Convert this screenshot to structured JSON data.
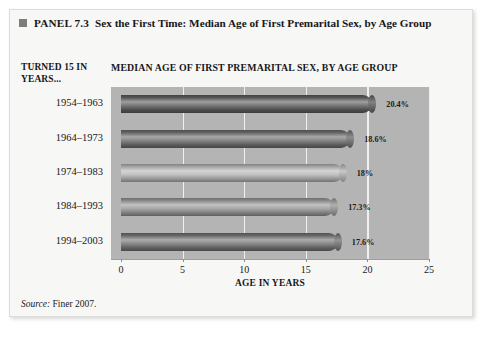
{
  "panel": {
    "marker_icon": "filled-square-icon",
    "number": "PANEL 7.3",
    "title": "Sex the First Time: Median Age of First Premarital Sex, by Age Group"
  },
  "row_header": "TURNED 15 IN YEARS...",
  "source": {
    "label": "Source:",
    "text": "Finer 2007."
  },
  "colors": {
    "plot_background": "#b4b4b4",
    "gridline": "#f0f0ee",
    "page_background": "#f7f7f6",
    "marker": "#7d7d7d"
  },
  "chart_data": {
    "type": "bar",
    "orientation": "horizontal",
    "title": "MEDIAN AGE OF FIRST PREMARITAL SEX, BY AGE GROUP",
    "xlabel": "AGE IN YEARS",
    "ylabel": "TURNED 15 IN YEARS...",
    "xlim": [
      0,
      25
    ],
    "xticks": [
      0,
      5,
      10,
      15,
      20,
      25
    ],
    "xtick_labels": [
      "0",
      "5",
      "10",
      "15",
      "20",
      "25"
    ],
    "grid": true,
    "legend": false,
    "categories": [
      "1954–1963",
      "1964–1973",
      "1974–1983",
      "1984–1993",
      "1994–2003"
    ],
    "values": [
      20.4,
      18.6,
      18,
      17.3,
      17.6
    ],
    "data_labels": [
      "20.4%",
      "18.6%",
      "18%",
      "17.3%",
      "17.6%"
    ],
    "bar_colors": [
      "#5f5f5f",
      "#707070",
      "#b8b8b8",
      "#9a9a9a",
      "#757575"
    ]
  }
}
